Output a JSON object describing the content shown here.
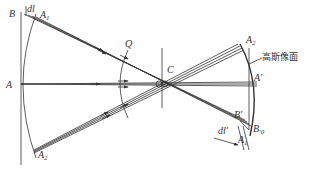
{
  "diagram": {
    "type": "optics-ray-diagram",
    "colors": {
      "line": "#333333",
      "background": "#ffffff"
    },
    "labels": {
      "B": "B",
      "dl": "dl",
      "A1": "A",
      "A1_sub": "1",
      "A": "A",
      "A2": "A",
      "A2_sub": "2",
      "Q": "Q",
      "C": "C",
      "A2p": "A",
      "A2p_sub": "2",
      "gauss_image_plane": "高斯像面",
      "Ap": "A'",
      "Bp": "B'",
      "B0p": "B",
      "B0p_sub": "0",
      "dlp": "dl'",
      "A1p": "A",
      "A1p_sub": "1"
    }
  }
}
